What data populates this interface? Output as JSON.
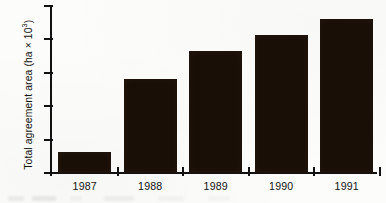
{
  "chart_data": {
    "type": "bar",
    "title": "",
    "xlabel": "",
    "ylabel": "Total agreement area (ha × 10³)",
    "ylabel_base": "Total agreement area (ha × 10",
    "ylabel_exponent": "3",
    "ylabel_tail": ")",
    "categories": [
      "1987",
      "1988",
      "1989",
      "1990",
      "1991"
    ],
    "values": [
      32,
      140,
      183,
      207,
      231
    ],
    "ylim": [
      0,
      250
    ],
    "ytick_labels": [
      "0",
      "50",
      "100",
      "150",
      "200",
      "250"
    ],
    "ytick_values": [
      0,
      50,
      100,
      150,
      200,
      250
    ],
    "grid": false,
    "legend": false,
    "bar_color": "#190f07",
    "axis_color": "#111111",
    "background_color": "#fcfcfa",
    "units": "ha × 10³"
  }
}
